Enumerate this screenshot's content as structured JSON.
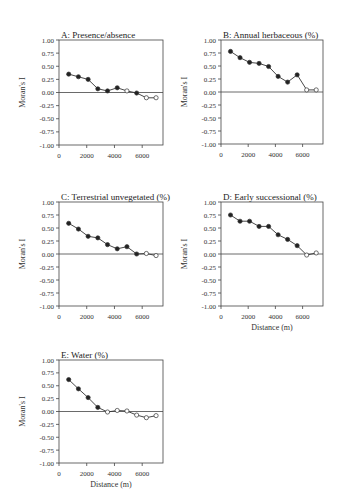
{
  "chart_data": [
    {
      "type": "line",
      "panel": "A",
      "title": "A: Presence/absence",
      "xlabel": "",
      "ylabel": "Moran's I",
      "ylim": [
        -1.0,
        1.0
      ],
      "xlim": [
        0,
        7500
      ],
      "yticks": [
        "1.00",
        "0.75",
        "0.50",
        "0.25",
        "0.00",
        "-0.25",
        "-0.50",
        "-0.75",
        "-1.00"
      ],
      "xticks": [
        "0",
        "2000",
        "4000",
        "6000"
      ],
      "grid": false,
      "x": [
        700,
        1400,
        2100,
        2800,
        3500,
        4200,
        4900,
        5600,
        6300,
        7000
      ],
      "values": [
        0.35,
        0.3,
        0.25,
        0.07,
        0.03,
        0.09,
        0.03,
        -0.01,
        -0.1,
        -0.1
      ],
      "significant": [
        true,
        true,
        true,
        true,
        true,
        true,
        false,
        true,
        false,
        false
      ]
    },
    {
      "type": "line",
      "panel": "B",
      "title": "B: Annual herbaceous (%)",
      "xlabel": "",
      "ylabel": "Moran's I",
      "ylim": [
        -1.0,
        1.0
      ],
      "xlim": [
        0,
        7500
      ],
      "yticks": [
        "1.00",
        "0.75",
        "0.50",
        "0.25",
        "0.00",
        "-0.25",
        "-0.50",
        "-0.75",
        "-1.00"
      ],
      "xticks": [
        "0",
        "2000",
        "4000",
        "6000"
      ],
      "grid": false,
      "x": [
        700,
        1400,
        2100,
        2800,
        3500,
        4200,
        4900,
        5600,
        6300,
        7000
      ],
      "values": [
        0.78,
        0.66,
        0.57,
        0.55,
        0.49,
        0.3,
        0.19,
        0.33,
        0.04,
        0.04
      ],
      "significant": [
        true,
        true,
        true,
        true,
        true,
        true,
        true,
        true,
        false,
        false
      ]
    },
    {
      "type": "line",
      "panel": "C",
      "title": "C: Terrestrial unvegetated (%)",
      "xlabel": "",
      "ylabel": "Moran's I",
      "ylim": [
        -1.0,
        1.0
      ],
      "xlim": [
        0,
        7500
      ],
      "yticks": [
        "1.00",
        "0.75",
        "0.50",
        "0.25",
        "0.00",
        "-0.25",
        "-0.50",
        "-0.75",
        "-1.00"
      ],
      "xticks": [
        "0",
        "2000",
        "4000",
        "6000"
      ],
      "grid": false,
      "x": [
        700,
        1400,
        2100,
        2800,
        3500,
        4200,
        4900,
        5600,
        6300,
        7000
      ],
      "values": [
        0.59,
        0.48,
        0.34,
        0.31,
        0.18,
        0.1,
        0.14,
        0.0,
        0.01,
        -0.03
      ],
      "significant": [
        true,
        true,
        true,
        true,
        true,
        true,
        true,
        true,
        false,
        false
      ]
    },
    {
      "type": "line",
      "panel": "D",
      "title": "D: Early successional (%)",
      "xlabel": "Distance (m)",
      "ylabel": "Moran's I",
      "ylim": [
        -1.0,
        1.0
      ],
      "xlim": [
        0,
        7500
      ],
      "yticks": [
        "1.00",
        "0.75",
        "0.50",
        "0.25",
        "0.00",
        "-0.25",
        "-0.50",
        "-0.75",
        "-1.00"
      ],
      "xticks": [
        "0",
        "2000",
        "4000",
        "6000"
      ],
      "grid": false,
      "x": [
        700,
        1400,
        2100,
        2800,
        3500,
        4200,
        4900,
        5600,
        6300,
        7000
      ],
      "values": [
        0.75,
        0.63,
        0.63,
        0.53,
        0.53,
        0.37,
        0.28,
        0.16,
        -0.02,
        0.02
      ],
      "significant": [
        true,
        true,
        true,
        true,
        true,
        true,
        true,
        true,
        false,
        false
      ]
    },
    {
      "type": "line",
      "panel": "E",
      "title": "E: Water (%)",
      "xlabel": "Distance (m)",
      "ylabel": "Moran's I",
      "ylim": [
        -1.0,
        1.0
      ],
      "xlim": [
        0,
        7500
      ],
      "yticks": [
        "1.00",
        "0.75",
        "0.50",
        "0.25",
        "0.00",
        "-0.25",
        "-0.50",
        "-0.75",
        "-1.00"
      ],
      "xticks": [
        "0",
        "2000",
        "4000",
        "6000"
      ],
      "grid": false,
      "x": [
        700,
        1400,
        2100,
        2800,
        3500,
        4200,
        4900,
        5600,
        6300,
        7000
      ],
      "values": [
        0.62,
        0.44,
        0.27,
        0.08,
        -0.01,
        0.02,
        0.01,
        -0.07,
        -0.12,
        -0.08
      ],
      "significant": [
        true,
        true,
        true,
        true,
        false,
        false,
        false,
        false,
        false,
        false
      ]
    }
  ],
  "layout": {
    "panels": [
      {
        "left": 59,
        "top": 40,
        "width": 104,
        "height": 105
      },
      {
        "left": 221,
        "top": 40,
        "width": 102,
        "height": 104
      },
      {
        "left": 59,
        "top": 202,
        "width": 104,
        "height": 104
      },
      {
        "left": 221,
        "top": 202,
        "width": 102,
        "height": 104
      },
      {
        "left": 59,
        "top": 360,
        "width": 104,
        "height": 103
      }
    ]
  }
}
